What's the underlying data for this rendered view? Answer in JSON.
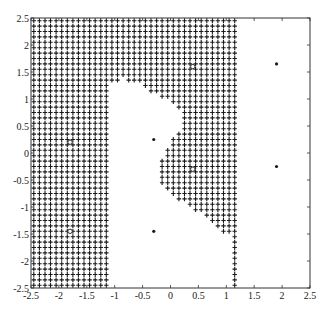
{
  "chart_data": {
    "type": "scatter",
    "title": "",
    "xlabel": "",
    "ylabel": "",
    "xlim": [
      -2.5,
      2.5
    ],
    "ylim": [
      -2.5,
      2.5
    ],
    "grid": false,
    "legend": null,
    "x_ticks": [
      -2.5,
      -2,
      -1.5,
      -1,
      -0.5,
      0,
      0.5,
      1,
      1.5,
      2,
      2.5
    ],
    "x_tick_labels": [
      "-2.5",
      "-2",
      "-1.5",
      "-1",
      "-0.5",
      "0",
      "0.5",
      "1",
      "1.5",
      "2",
      "2.5"
    ],
    "y_ticks": [
      2.5,
      2,
      1.5,
      1,
      0.5,
      0,
      -0.5,
      -1,
      -1.5,
      -2,
      -2.5
    ],
    "y_tick_labels": [
      "2.5",
      "2",
      "1.5",
      "1",
      "0.5",
      "0",
      "-0.5",
      "-1",
      "-1.5",
      "-2",
      "-2.5"
    ],
    "series": [
      {
        "name": "class-o",
        "marker": "o",
        "points": [
          [
            -1.8,
            0.2
          ],
          [
            -1.8,
            -1.45
          ],
          [
            0.4,
            1.6
          ],
          [
            0.4,
            -0.3
          ]
        ]
      },
      {
        "name": "class-star",
        "marker": "*",
        "points": [
          [
            -0.3,
            0.25
          ],
          [
            -0.3,
            -1.45
          ],
          [
            1.9,
            1.65
          ],
          [
            1.9,
            -0.25
          ]
        ]
      },
      {
        "name": "decision-region",
        "marker": "+",
        "grid_step": 0.1,
        "region_x_max": 1.15,
        "left_band_x_max": -1.1,
        "white_cutout_polygon": [
          [
            -1.1,
            1.3
          ],
          [
            -0.85,
            1.38
          ],
          [
            -0.6,
            1.3
          ],
          [
            -0.4,
            1.15
          ],
          [
            -0.2,
            1.05
          ],
          [
            0.0,
            0.95
          ],
          [
            0.15,
            0.8
          ],
          [
            0.27,
            0.6
          ],
          [
            0.15,
            0.42
          ],
          [
            0.05,
            0.25
          ],
          [
            -0.05,
            0.05
          ],
          [
            -0.15,
            -0.15
          ],
          [
            -0.2,
            -0.45
          ],
          [
            -0.2,
            -0.55
          ],
          [
            0.0,
            -0.75
          ],
          [
            0.3,
            -0.95
          ],
          [
            0.6,
            -1.15
          ],
          [
            0.85,
            -1.35
          ],
          [
            1.0,
            -1.5
          ],
          [
            1.15,
            -1.6
          ],
          [
            1.15,
            -2.6
          ],
          [
            -1.1,
            -2.6
          ]
        ]
      }
    ]
  },
  "plot_frame": {
    "left_px": 31,
    "right_px": 310,
    "top_px": 18,
    "bottom_px": 288
  },
  "colors": {
    "ink": "#1a1a1a",
    "axis": "#333333",
    "background": "#ffffff"
  }
}
